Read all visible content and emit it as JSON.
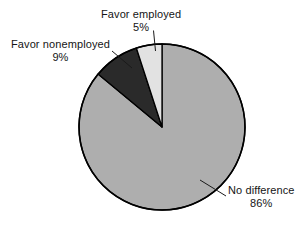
{
  "chart_data": {
    "type": "pie",
    "title": "",
    "subtitle": "",
    "xlabel": "",
    "ylabel": "",
    "legend_position": "none",
    "grid": false,
    "unit": "%",
    "start_angle_deg": 90,
    "direction": "counterclockwise",
    "categories": [
      "Favor employed",
      "Favor nonemployed",
      "No difference"
    ],
    "values": [
      5,
      9,
      86
    ],
    "slices": [
      {
        "label": "Favor employed",
        "value": 5,
        "value_text": "5%",
        "color": "#e2e2e2",
        "start_deg": 90,
        "sweep_deg": 18
      },
      {
        "label": "Favor nonemployed",
        "value": 9,
        "value_text": "9%",
        "color": "#2a2a2a",
        "start_deg": 108,
        "sweep_deg": 32.4
      },
      {
        "label": "No difference",
        "value": 86,
        "value_text": "86%",
        "color": "#aeaeae",
        "start_deg": 140.4,
        "sweep_deg": 309.6
      }
    ]
  },
  "labels": {
    "favor_employed": {
      "name": "Favor employed",
      "value": "5%"
    },
    "favor_nonemployed": {
      "name": "Favor nonemployed",
      "value": "9%"
    },
    "no_difference": {
      "name": "No difference",
      "value": "86%"
    }
  },
  "colors": {
    "background": "#ffffff",
    "outline": "#000000",
    "text": "#151515",
    "slice_light": "#e2e2e2",
    "slice_dark": "#2a2a2a",
    "slice_medium": "#aeaeae"
  }
}
